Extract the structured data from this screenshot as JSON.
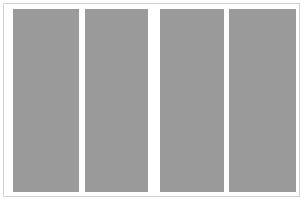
{
  "canvas": {
    "width": 307,
    "height": 204,
    "background_color": "#ffffff"
  },
  "card": {
    "border_color": "#d2d2d2",
    "border_width": 1,
    "background_color": "#ffffff",
    "x": 3,
    "y": 3,
    "width": 297,
    "height": 194
  },
  "placeholder_block": {
    "fill_color": "#9a9a9a",
    "count": 4,
    "top": 9,
    "height": 183,
    "columns": [
      {
        "id": "column-1",
        "x": 13,
        "width": 66,
        "gap_after": 6
      },
      {
        "id": "column-2",
        "x": 85,
        "width": 63,
        "gap_after": 12
      },
      {
        "id": "column-3",
        "x": 160,
        "width": 64,
        "gap_after": 5
      },
      {
        "id": "column-4",
        "x": 229,
        "width": 67,
        "gap_after": 0
      }
    ]
  },
  "text": {
    "none_present": ""
  }
}
